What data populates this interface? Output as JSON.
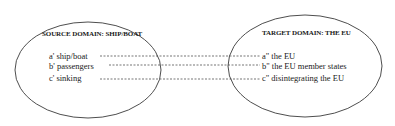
{
  "source_domain": {
    "title": "SOURCE DOMAIN: SHIP/BOAT",
    "items": [
      {
        "label": "a' ship/boat"
      },
      {
        "label": "b' passengers"
      },
      {
        "label": "c' sinking"
      }
    ]
  },
  "target_domain": {
    "title": "TARGET DOMAIN: THE EU",
    "items": [
      {
        "label": "a\" the EU"
      },
      {
        "label": "b\" the EU member states"
      },
      {
        "label": "c\" disintegrating the EU"
      }
    ]
  },
  "colors": {
    "stroke": "#3a3a3a",
    "text": "#1a1a1a"
  }
}
